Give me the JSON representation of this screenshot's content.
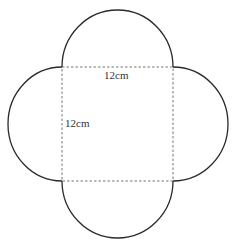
{
  "diagram": {
    "labels": {
      "top_side": "12cm",
      "left_side": "12cm"
    },
    "colors": {
      "outline": "#2a2a2a",
      "dashed": "#666666",
      "text": "#333333"
    }
  }
}
